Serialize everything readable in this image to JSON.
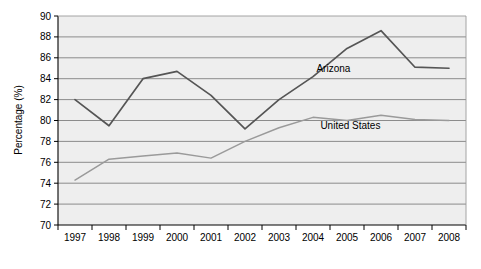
{
  "chart_data": {
    "type": "line",
    "title": "",
    "subtitle": "",
    "xlabel": "",
    "ylabel": "Percentage (%)",
    "categories": [
      "1997",
      "1998",
      "1999",
      "2000",
      "2001",
      "2002",
      "2003",
      "2004",
      "2005",
      "2006",
      "2007",
      "2008"
    ],
    "x": [
      1997,
      1998,
      1999,
      2000,
      2001,
      2002,
      2003,
      2004,
      2005,
      2006,
      2007,
      2008
    ],
    "ylim": [
      70,
      90
    ],
    "yticks": [
      70,
      72,
      74,
      76,
      78,
      80,
      82,
      84,
      86,
      88,
      90
    ],
    "ytick_labels": [
      "70",
      "72",
      "74",
      "76",
      "78",
      "80",
      "82",
      "84",
      "86",
      "88",
      "90"
    ],
    "grid": true,
    "legend_position": "inline-annotations",
    "series": [
      {
        "name": "Arizona",
        "color": "#555555",
        "values": [
          82.0,
          79.5,
          84.0,
          84.7,
          82.4,
          79.2,
          82.0,
          84.2,
          86.9,
          88.6,
          85.1,
          85.0
        ],
        "label_x": 2004.6,
        "label_y": 84.6
      },
      {
        "name": "United States",
        "color": "#9a9a9a",
        "values": [
          74.3,
          76.3,
          76.6,
          76.9,
          76.4,
          78.0,
          79.3,
          80.3,
          80.0,
          80.5,
          80.1,
          80.0
        ],
        "label_x": 2005.1,
        "label_y": 79.2
      }
    ],
    "annotations": [
      {
        "text": "Arizona",
        "x": 2004.6,
        "y": 84.6
      },
      {
        "text": "United States",
        "x": 2005.1,
        "y": 79.2
      }
    ]
  }
}
